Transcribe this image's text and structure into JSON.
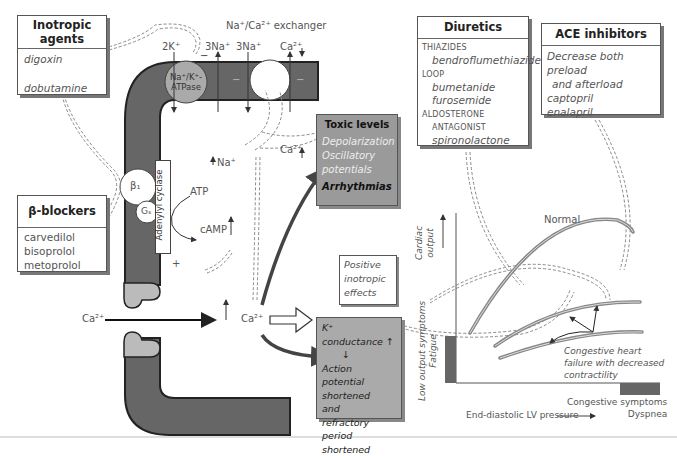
{
  "inotropic_agents": {
    "title_line1": "Inotropic",
    "title_line2": "agents",
    "items": [
      "digoxin",
      "dobutamine"
    ]
  },
  "beta_blockers": {
    "title": "β-blockers",
    "items": [
      "carvedilol",
      "bisoprolol",
      "metoprolol"
    ]
  },
  "diuretics": {
    "title": "Diuretics",
    "groups": [
      {
        "category": "THIAZIDES",
        "drugs": [
          "bendroflumethiazide"
        ]
      },
      {
        "category": "LOOP",
        "drugs": [
          "bumetanide",
          "furosemide"
        ]
      },
      {
        "category": "ALDOSTERONE",
        "subcategory": "ANTAGONIST",
        "drugs": [
          "spironolactone"
        ]
      }
    ]
  },
  "ace_inhibitors": {
    "title": "ACE inhibitors",
    "lines": [
      "Decrease both preload",
      "and afterload",
      "captopril",
      "enalapril"
    ]
  },
  "membrane": {
    "exchanger_label": "Na⁺/Ca²⁺ exchanger",
    "pump_label_1": "Na⁺/K⁺-",
    "pump_label_2": "ATPase",
    "ion_2k": "2K⁺",
    "ion_3na_a": "3Na⁺",
    "ion_3na_b": "3Na⁺",
    "ion_ca_out": "Ca²⁺",
    "ion_na_in": "Na⁺",
    "ion_ca_in": "Ca²⁺",
    "minus": "−",
    "beta1": "β₁",
    "gs": "Gₛ",
    "adenylyl": "Adenylyl cyclase",
    "atp": "ATP",
    "camp": "cAMP",
    "plus": "+",
    "ca_channel_in": "Ca²⁺",
    "ca_cytosol": "Ca²⁺"
  },
  "toxic": {
    "title": "Toxic levels",
    "lines": [
      "Depolarization",
      "Oscillatory",
      "potentials"
    ],
    "bold": "Arrhythmias"
  },
  "positive": {
    "lines": [
      "Positive",
      "inotropic",
      "effects"
    ]
  },
  "kconductance": {
    "title": "K⁺ conductance",
    "lines": [
      "Action potential",
      "shortened",
      "and",
      "refractory period",
      "shortened"
    ]
  },
  "graph": {
    "y_label_1": "Cardiac",
    "y_label_2": "output",
    "normal": "Normal",
    "chf_lines": [
      "Congestive heart",
      "failure with decreased",
      "contractility"
    ],
    "low_output_1": "Low output symptoms",
    "low_output_2": "Fatigue",
    "congestive_1": "Congestive symptoms",
    "congestive_2": "Dyspnea",
    "x_label": "End-diastolic LV pressure"
  }
}
